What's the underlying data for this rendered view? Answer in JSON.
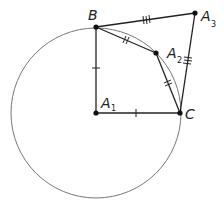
{
  "diagram": {
    "type": "geometry",
    "circle": {
      "center": "A1",
      "cx": 96,
      "cy": 113,
      "r": 85,
      "stroke": "#777777"
    },
    "points": [
      {
        "name": "B",
        "x": 96,
        "y": 27,
        "label": "B",
        "sub": ""
      },
      {
        "name": "A1",
        "x": 96,
        "y": 113,
        "label": "A",
        "sub": "1"
      },
      {
        "name": "C",
        "x": 180,
        "y": 113,
        "label": "C",
        "sub": ""
      },
      {
        "name": "A2",
        "x": 156,
        "y": 53,
        "label": "A",
        "sub": "2"
      },
      {
        "name": "A3",
        "x": 195,
        "y": 13,
        "label": "A",
        "sub": "3"
      }
    ],
    "segments": [
      {
        "from": "B",
        "to": "A1",
        "ticks": 1
      },
      {
        "from": "A1",
        "to": "C",
        "ticks": 1
      },
      {
        "from": "B",
        "to": "A2",
        "ticks": 2
      },
      {
        "from": "A2",
        "to": "C",
        "ticks": 2
      },
      {
        "from": "B",
        "to": "A3",
        "ticks": 3
      },
      {
        "from": "A3",
        "to": "C",
        "ticks": 3
      }
    ],
    "colors": {
      "line": "#222222",
      "circle": "#777777",
      "point": "#111111"
    }
  }
}
